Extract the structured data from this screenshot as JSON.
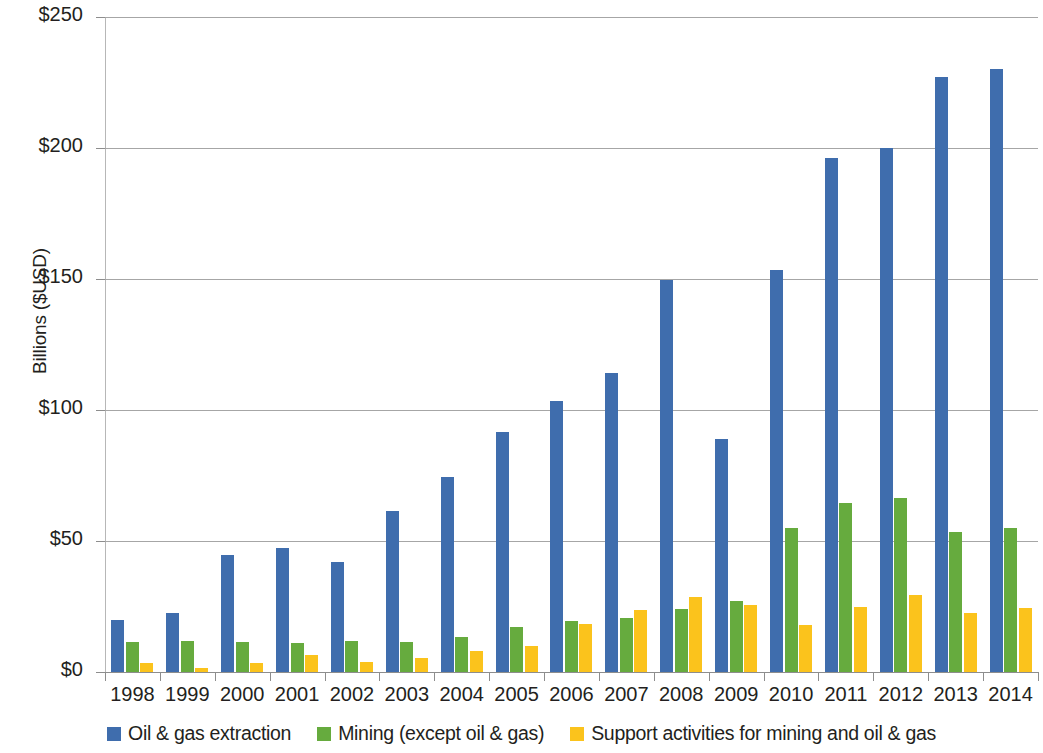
{
  "chart_data": {
    "type": "bar",
    "title": "",
    "subtitle": "",
    "xlabel": "",
    "ylabel": "Billions ($USD)",
    "ylim": [
      0,
      250
    ],
    "yticks": [
      0,
      50,
      100,
      150,
      200,
      250
    ],
    "ytick_labels": [
      "$0",
      "$50",
      "$100",
      "$150",
      "$200",
      "$250"
    ],
    "grid": true,
    "legend_position": "bottom",
    "categories": [
      "1998",
      "1999",
      "2000",
      "2001",
      "2002",
      "2003",
      "2004",
      "2005",
      "2006",
      "2007",
      "2008",
      "2009",
      "2010",
      "2011",
      "2012",
      "2013",
      "2014"
    ],
    "series": [
      {
        "name": "Oil & gas extraction",
        "color": "#3f6dad",
        "values": [
          20,
          22.5,
          44.5,
          47.5,
          42,
          61.5,
          74.5,
          91.5,
          103.5,
          114,
          149.5,
          89,
          153.5,
          196,
          200,
          227,
          230
        ]
      },
      {
        "name": "Mining (except oil & gas)",
        "color": "#66ab3e",
        "values": [
          11.5,
          12,
          11.5,
          11,
          12,
          11.5,
          13.5,
          17,
          19.5,
          20.5,
          24,
          27,
          55,
          64.5,
          66.5,
          53.5,
          55
        ]
      },
      {
        "name": "Support activities for mining and oil & gas",
        "color": "#fbc31c",
        "values": [
          3.5,
          1.5,
          3.5,
          6.5,
          4,
          5.5,
          8,
          10,
          18.5,
          23.5,
          28.5,
          25.5,
          18,
          25,
          29.5,
          22.5,
          24.5
        ]
      }
    ]
  },
  "axis": {
    "y_title": "Billions ($USD)"
  },
  "legend": {
    "items": [
      {
        "label": "Oil & gas extraction",
        "color": "#3f6dad"
      },
      {
        "label": "Mining (except oil & gas)",
        "color": "#66ab3e"
      },
      {
        "label": "Support activities for mining and oil & gas",
        "color": "#fbc31c"
      }
    ]
  }
}
